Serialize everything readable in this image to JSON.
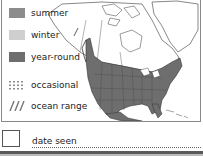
{
  "legend": {
    "items": [
      {
        "label": "summer",
        "color": "#8c8c8c",
        "pattern": "solid"
      },
      {
        "label": "winter",
        "color": "#cfcfcf",
        "pattern": "solid"
      },
      {
        "label": "year-round",
        "color": "#6e6e6e",
        "pattern": "solid"
      },
      {
        "label": "occasional",
        "color": "#8c8c8c",
        "pattern": "dotted"
      },
      {
        "label": "ocean range",
        "color": "#777777",
        "pattern": "hatched"
      }
    ]
  },
  "map": {
    "region": "North America",
    "range_color": "#6e6e6e",
    "land_color": "#ffffff",
    "border_color": "#333333"
  },
  "date_field": {
    "label": "date seen",
    "value": ""
  }
}
